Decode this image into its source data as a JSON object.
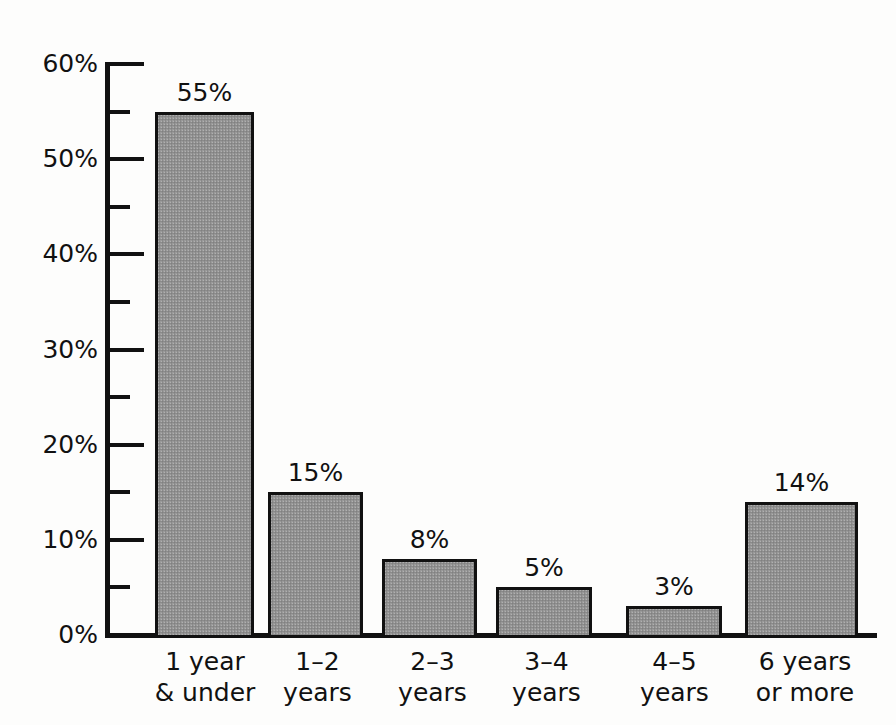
{
  "chart_data": {
    "type": "bar",
    "xlabel": "",
    "ylabel": "Percent of Families",
    "ylim": [
      0,
      60
    ],
    "grid": false,
    "legend": false,
    "bar_fill_color": "#9a9a9a",
    "bar_border_color": "#111111",
    "background_color": "#fdfdfc",
    "categories": [
      "1 year\n& under",
      "1–2\nyears",
      "2–3\nyears",
      "3–4\nyears",
      "4–5\nyears",
      "6 years\nor more"
    ],
    "category_lines": [
      [
        "1 year",
        "& under"
      ],
      [
        "1–2",
        "years"
      ],
      [
        "2–3",
        "years"
      ],
      [
        "3–4",
        "years"
      ],
      [
        "4–5",
        "years"
      ],
      [
        "6 years",
        "or more"
      ]
    ],
    "values": [
      55,
      15,
      8,
      5,
      3,
      14
    ],
    "value_labels": [
      "55%",
      "15%",
      "8%",
      "5%",
      "3%",
      "14%"
    ],
    "y_major_ticks": [
      0,
      10,
      20,
      30,
      40,
      50,
      60
    ],
    "y_major_tick_labels": [
      "0%",
      "10%",
      "20%",
      "30%",
      "40%",
      "50%",
      "60%"
    ],
    "y_minor_ticks": [
      5,
      15,
      25,
      35,
      45,
      55
    ],
    "y_tick_suffix": "%"
  }
}
